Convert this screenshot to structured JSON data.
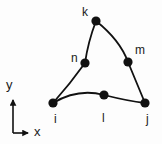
{
  "figure": {
    "type": "mesh-element-diagram",
    "background_color": "#fdfdfd",
    "ink_color": "#111111",
    "width": 162,
    "height": 144
  },
  "axes": {
    "x_label": "x",
    "y_label": "y",
    "origin": {
      "x": 13,
      "y": 133
    },
    "x_tip": {
      "x": 31,
      "y": 133
    },
    "y_tip": {
      "x": 13,
      "y": 97
    },
    "x_label_pos": {
      "x": 34,
      "y": 126
    },
    "y_label_pos": {
      "x": 6,
      "y": 79
    }
  },
  "nodes": [
    {
      "id": "i",
      "label": "i",
      "x": 53,
      "y": 103,
      "role": "corner",
      "label_x": 54,
      "label_y": 113
    },
    {
      "id": "j",
      "label": "j",
      "x": 145,
      "y": 103,
      "role": "corner",
      "label_x": 146,
      "label_y": 113
    },
    {
      "id": "k",
      "label": "k",
      "x": 96,
      "y": 21,
      "role": "corner",
      "label_x": 82,
      "label_y": 6
    },
    {
      "id": "l",
      "label": "l",
      "x": 104,
      "y": 95,
      "role": "midside",
      "label_x": 102,
      "label_y": 112
    },
    {
      "id": "m",
      "label": "m",
      "x": 128,
      "y": 62,
      "role": "midside",
      "label_x": 135,
      "label_y": 44
    },
    {
      "id": "n",
      "label": "n",
      "x": 85,
      "y": 63,
      "role": "midside",
      "label_x": 71,
      "label_y": 52
    }
  ],
  "edges": [
    {
      "id": "edge-i-l-j",
      "from": "i",
      "mid": "l",
      "to": "j",
      "path": "M 53 103 Q 78 88 104 95 Q 128 101 145 103"
    },
    {
      "id": "edge-j-m-k",
      "from": "j",
      "mid": "m",
      "to": "k",
      "path": "M 145 103 L 128 62 Q 120 40 96 21"
    },
    {
      "id": "edge-k-n-i",
      "from": "k",
      "mid": "n",
      "to": "i",
      "path": "M 96 21 Q 88 42 85 63 Q 70 84 53 103"
    }
  ],
  "style": {
    "node_radius": 4.6,
    "edge_width": 1.8,
    "axis_width": 1.6
  }
}
